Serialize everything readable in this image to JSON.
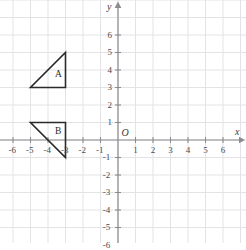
{
  "figure": {
    "type": "coordinate-plane",
    "background_color": "#ffffff",
    "grid_color": "#e3e3e6",
    "axis_color": "#8c8c90",
    "shape_stroke_color": "#2b2b2b",
    "label_color": "#4a4a4a"
  },
  "axes": {
    "x_name": "x",
    "y_name": "y",
    "origin_label": "O",
    "x_range": [
      -7,
      7
    ],
    "y_range": [
      -7,
      7
    ],
    "x_tick_labels": [
      "-6",
      "-5",
      "-4",
      "-3",
      "-2",
      "-1",
      "1",
      "2",
      "3",
      "4",
      "5",
      "6"
    ],
    "x_tick_values": [
      -6,
      -5,
      -4,
      -3,
      -2,
      -1,
      1,
      2,
      3,
      4,
      5,
      6
    ],
    "y_tick_labels": [
      "6",
      "5",
      "4",
      "3",
      "2",
      "1",
      "-1",
      "-2",
      "-3",
      "-4",
      "-5",
      "-6"
    ],
    "y_tick_values": [
      6,
      5,
      4,
      3,
      2,
      1,
      -1,
      -2,
      -3,
      -4,
      -5,
      -6
    ],
    "grid_step": 1,
    "arrows": [
      "x-positive",
      "y-positive"
    ]
  },
  "shapes": [
    {
      "label": "A",
      "kind": "right-triangle",
      "vertices": [
        [
          -5,
          3
        ],
        [
          -3,
          3
        ],
        [
          -3,
          5
        ]
      ],
      "label_position": [
        -3.6,
        3.7
      ]
    },
    {
      "label": "B",
      "kind": "right-triangle",
      "vertices": [
        [
          -5,
          1
        ],
        [
          -3,
          1
        ],
        [
          -3,
          -1
        ]
      ],
      "label_position": [
        -3.6,
        0.45
      ]
    }
  ],
  "chart_data": {
    "type": "scatter",
    "title": "",
    "xlabel": "x",
    "ylabel": "y",
    "xlim": [
      -7,
      7
    ],
    "ylim": [
      -7,
      7
    ],
    "grid": true,
    "legend": "none",
    "series": [
      {
        "name": "A",
        "x": [
          -5,
          -3,
          -3,
          -5
        ],
        "y": [
          3,
          3,
          5,
          3
        ]
      },
      {
        "name": "B",
        "x": [
          -5,
          -3,
          -3,
          -5
        ],
        "y": [
          1,
          1,
          -1,
          1
        ]
      }
    ]
  }
}
